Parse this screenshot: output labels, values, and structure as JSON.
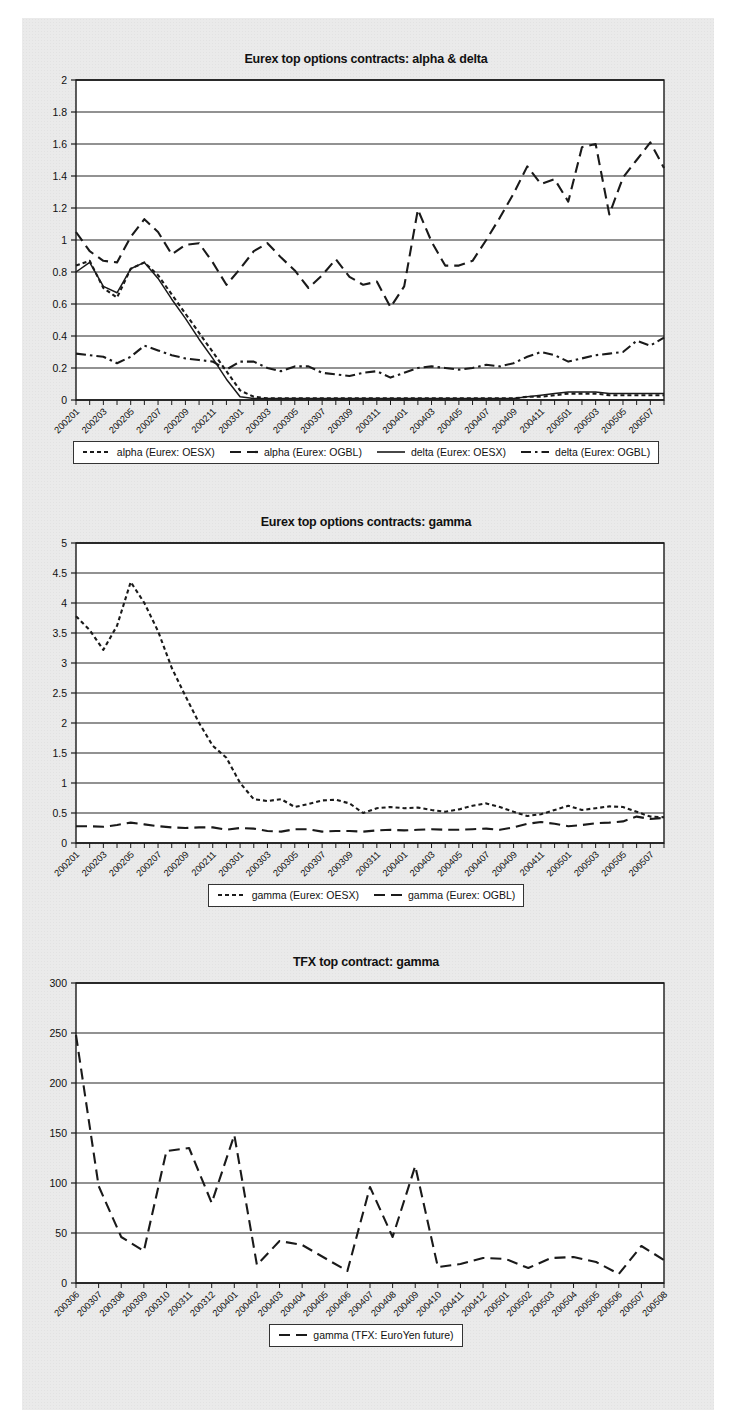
{
  "page": {
    "background": "#eaeaea",
    "ink": "#1a1a1a"
  },
  "charts": [
    {
      "id": "eurex-alpha-delta",
      "title": "Eurex top options contracts: alpha & delta",
      "legend": [
        {
          "label": "alpha (Eurex: OESX)",
          "style": "dotted"
        },
        {
          "label": "alpha (Eurex: OGBL)",
          "style": "dashed"
        },
        {
          "label": "delta (Eurex: OESX)",
          "style": "solid"
        },
        {
          "label": "delta (Eurex: OGBL)",
          "style": "dashdot"
        }
      ]
    },
    {
      "id": "eurex-gamma",
      "title": "Eurex top options contracts: gamma",
      "legend": [
        {
          "label": "gamma (Eurex: OESX)",
          "style": "dotted"
        },
        {
          "label": "gamma (Eurex: OGBL)",
          "style": "dashed"
        }
      ]
    },
    {
      "id": "tfx-gamma",
      "title": "TFX top contract: gamma",
      "legend": [
        {
          "label": "gamma (TFX: EuroYen future)",
          "style": "dashed"
        }
      ]
    }
  ],
  "chart_data": [
    {
      "type": "line",
      "title": "Eurex top options contracts: alpha & delta",
      "xlabel": "",
      "ylabel": "",
      "ylim": [
        0,
        2
      ],
      "yticks": [
        0,
        0.2,
        0.4,
        0.6,
        0.8,
        1,
        1.2,
        1.4,
        1.6,
        1.8,
        2
      ],
      "ytick_labels": [
        "0",
        "0.2",
        "0.4",
        "0.6",
        "0.8",
        "1",
        "1.2",
        "1.4",
        "1.6",
        "1.8",
        "2"
      ],
      "grid": true,
      "legend_position": "below",
      "x": [
        "200201",
        "200202",
        "200203",
        "200204",
        "200205",
        "200206",
        "200207",
        "200208",
        "200209",
        "200210",
        "200211",
        "200212",
        "200301",
        "200302",
        "200303",
        "200304",
        "200305",
        "200306",
        "200307",
        "200308",
        "200309",
        "200310",
        "200311",
        "200312",
        "200401",
        "200402",
        "200403",
        "200404",
        "200405",
        "200406",
        "200407",
        "200408",
        "200409",
        "200410",
        "200411",
        "200412",
        "200501",
        "200502",
        "200503",
        "200504",
        "200505",
        "200506",
        "200507",
        "200508"
      ],
      "xtick_labels": [
        "200201",
        "200203",
        "200205",
        "200207",
        "200209",
        "200211",
        "200301",
        "200303",
        "200305",
        "200307",
        "200309",
        "200311",
        "200401",
        "200403",
        "200405",
        "200407",
        "200409",
        "200411",
        "200501",
        "200503",
        "200505",
        "200507"
      ],
      "series": [
        {
          "name": "alpha (Eurex: OESX)",
          "style": "dotted",
          "values": [
            0.84,
            0.87,
            0.7,
            0.64,
            0.82,
            0.86,
            0.78,
            0.66,
            0.54,
            0.42,
            0.3,
            0.18,
            0.06,
            0.02,
            0.01,
            0.01,
            0.01,
            0.01,
            0.01,
            0.01,
            0.01,
            0.01,
            0.01,
            0.01,
            0.01,
            0.01,
            0.01,
            0.01,
            0.01,
            0.01,
            0.01,
            0.01,
            0.01,
            0.02,
            0.02,
            0.03,
            0.04,
            0.04,
            0.04,
            0.03,
            0.03,
            0.03,
            0.03,
            0.03
          ]
        },
        {
          "name": "alpha (Eurex: OGBL)",
          "style": "dashed",
          "values": [
            1.05,
            0.93,
            0.87,
            0.86,
            1.02,
            1.13,
            1.05,
            0.91,
            0.97,
            0.98,
            0.86,
            0.72,
            0.82,
            0.93,
            0.98,
            0.89,
            0.81,
            0.7,
            0.78,
            0.88,
            0.77,
            0.72,
            0.74,
            0.58,
            0.71,
            1.19,
            0.99,
            0.84,
            0.84,
            0.87,
            1.0,
            1.14,
            1.29,
            1.46,
            1.35,
            1.38,
            1.24,
            1.58,
            1.6,
            1.16,
            1.39,
            1.5,
            1.61,
            1.45
          ]
        },
        {
          "name": "delta (Eurex: OESX)",
          "style": "solid",
          "values": [
            0.8,
            0.86,
            0.71,
            0.67,
            0.82,
            0.86,
            0.76,
            0.63,
            0.51,
            0.38,
            0.26,
            0.13,
            0.02,
            0.01,
            0.01,
            0.01,
            0.01,
            0.01,
            0.01,
            0.01,
            0.01,
            0.01,
            0.01,
            0.01,
            0.01,
            0.01,
            0.01,
            0.01,
            0.01,
            0.01,
            0.01,
            0.01,
            0.01,
            0.02,
            0.03,
            0.04,
            0.05,
            0.05,
            0.05,
            0.04,
            0.04,
            0.04,
            0.04,
            0.04
          ]
        },
        {
          "name": "delta (Eurex: OGBL)",
          "style": "dashdot",
          "values": [
            0.29,
            0.28,
            0.27,
            0.23,
            0.27,
            0.34,
            0.31,
            0.28,
            0.26,
            0.25,
            0.24,
            0.19,
            0.24,
            0.24,
            0.2,
            0.18,
            0.21,
            0.21,
            0.17,
            0.16,
            0.15,
            0.17,
            0.18,
            0.14,
            0.17,
            0.2,
            0.21,
            0.2,
            0.19,
            0.2,
            0.22,
            0.21,
            0.23,
            0.27,
            0.3,
            0.28,
            0.24,
            0.26,
            0.28,
            0.29,
            0.3,
            0.37,
            0.34,
            0.39
          ]
        }
      ]
    },
    {
      "type": "line",
      "title": "Eurex top options contracts: gamma",
      "xlabel": "",
      "ylabel": "",
      "ylim": [
        0,
        5
      ],
      "yticks": [
        0,
        0.5,
        1,
        1.5,
        2,
        2.5,
        3,
        3.5,
        4,
        4.5,
        5
      ],
      "ytick_labels": [
        "0",
        "0.5",
        "1",
        "1.5",
        "2",
        "2.5",
        "3",
        "3.5",
        "4",
        "4.5",
        "5"
      ],
      "grid": true,
      "legend_position": "below",
      "x": [
        "200201",
        "200202",
        "200203",
        "200204",
        "200205",
        "200206",
        "200207",
        "200208",
        "200209",
        "200210",
        "200211",
        "200212",
        "200301",
        "200302",
        "200303",
        "200304",
        "200305",
        "200306",
        "200307",
        "200308",
        "200309",
        "200310",
        "200311",
        "200312",
        "200401",
        "200402",
        "200403",
        "200404",
        "200405",
        "200406",
        "200407",
        "200408",
        "200409",
        "200410",
        "200411",
        "200412",
        "200501",
        "200502",
        "200503",
        "200504",
        "200505",
        "200506",
        "200507",
        "200508"
      ],
      "xtick_labels": [
        "200201",
        "200203",
        "200205",
        "200207",
        "200209",
        "200211",
        "200301",
        "200303",
        "200305",
        "200307",
        "200309",
        "200311",
        "200401",
        "200403",
        "200405",
        "200407",
        "200409",
        "200411",
        "200501",
        "200503",
        "200505",
        "200507"
      ],
      "series": [
        {
          "name": "gamma (Eurex: OESX)",
          "style": "dotted",
          "values": [
            3.78,
            3.55,
            3.22,
            3.62,
            4.35,
            4.0,
            3.53,
            2.92,
            2.45,
            2.0,
            1.62,
            1.42,
            1.0,
            0.73,
            0.7,
            0.73,
            0.6,
            0.65,
            0.71,
            0.72,
            0.66,
            0.5,
            0.58,
            0.6,
            0.58,
            0.59,
            0.55,
            0.52,
            0.56,
            0.62,
            0.66,
            0.6,
            0.52,
            0.45,
            0.48,
            0.55,
            0.62,
            0.55,
            0.58,
            0.61,
            0.6,
            0.52,
            0.44,
            0.43
          ]
        },
        {
          "name": "gamma (Eurex: OGBL)",
          "style": "dashed",
          "values": [
            0.28,
            0.28,
            0.27,
            0.3,
            0.34,
            0.31,
            0.28,
            0.26,
            0.25,
            0.26,
            0.26,
            0.22,
            0.25,
            0.24,
            0.2,
            0.19,
            0.23,
            0.23,
            0.19,
            0.2,
            0.2,
            0.19,
            0.21,
            0.22,
            0.21,
            0.22,
            0.23,
            0.22,
            0.22,
            0.23,
            0.24,
            0.22,
            0.26,
            0.32,
            0.35,
            0.32,
            0.28,
            0.3,
            0.33,
            0.34,
            0.36,
            0.44,
            0.4,
            0.42
          ]
        }
      ]
    },
    {
      "type": "line",
      "title": "TFX top contract: gamma",
      "xlabel": "",
      "ylabel": "",
      "ylim": [
        0,
        300
      ],
      "yticks": [
        0,
        50,
        100,
        150,
        200,
        250,
        300
      ],
      "ytick_labels": [
        "0",
        "50",
        "100",
        "150",
        "200",
        "250",
        "300"
      ],
      "grid": true,
      "legend_position": "below",
      "x": [
        "200306",
        "200307",
        "200308",
        "200309",
        "200310",
        "200311",
        "200312",
        "200401",
        "200402",
        "200403",
        "200404",
        "200405",
        "200406",
        "200407",
        "200408",
        "200409",
        "200410",
        "200411",
        "200412",
        "200501",
        "200502",
        "200503",
        "200504",
        "200505",
        "200506",
        "200507",
        "200508"
      ],
      "xtick_labels": [
        "200306",
        "200307",
        "200308",
        "200309",
        "200310",
        "200311",
        "200312",
        "200401",
        "200402",
        "200403",
        "200404",
        "200405",
        "200406",
        "200407",
        "200408",
        "200409",
        "200410",
        "200411",
        "200412",
        "200501",
        "200502",
        "200503",
        "200504",
        "200505",
        "200506",
        "200507",
        "200508"
      ],
      "series": [
        {
          "name": "gamma (TFX: EuroYen future)",
          "style": "dashed",
          "values": [
            248,
            97,
            46,
            32,
            132,
            135,
            80,
            148,
            18,
            42,
            38,
            25,
            12,
            96,
            46,
            117,
            16,
            19,
            25,
            24,
            15,
            25,
            26,
            21,
            9,
            37,
            23
          ]
        }
      ]
    }
  ]
}
